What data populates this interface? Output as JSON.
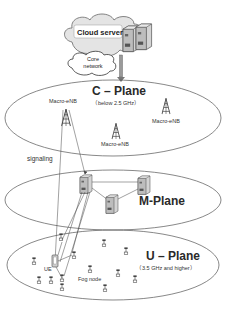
{
  "cloud": {
    "server_label": "Cloud server",
    "core_network_label_line1": "Core",
    "core_network_label_line2": "network"
  },
  "c_plane": {
    "title": "C – Plane",
    "subtitle": "（below 2.5 GHz）",
    "macro_enb_labels": [
      "Macro-eNB",
      "Macro-eNB",
      "Macro-eNB"
    ]
  },
  "signaling_label": "signaling",
  "m_plane": {
    "title": "M-Plane"
  },
  "u_plane": {
    "title": "U – Plane",
    "subtitle": "（3.5 GHz and higher）",
    "ue_label": "UE",
    "fog_node_label": "Fog node"
  },
  "colors": {
    "ellipse_stroke": "#555555",
    "text": "#222222",
    "cloud_fill": "#e6e6e6",
    "server_fill": "#cfcfcf"
  }
}
